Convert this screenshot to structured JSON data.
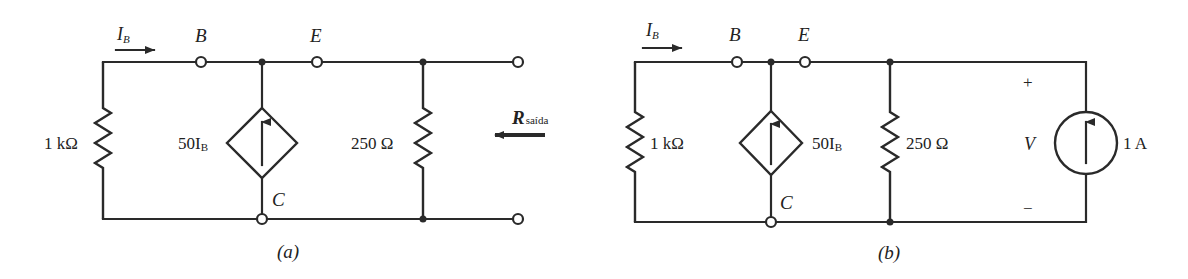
{
  "figure": {
    "colors": {
      "ink": "#2a2a2a",
      "background": "#ffffff"
    },
    "circuit_a": {
      "caption": "(a)",
      "current_label": {
        "main": "I",
        "sub": "B"
      },
      "nodes": {
        "base": "B",
        "emitter": "E",
        "collector": "C"
      },
      "resistor_left": "1 kΩ",
      "dependent_source": {
        "main": "50I",
        "sub": "B"
      },
      "resistor_right": "250 Ω",
      "output_resistance": {
        "main": "R",
        "sub": "saída"
      }
    },
    "circuit_b": {
      "caption": "(b)",
      "current_label": {
        "main": "I",
        "sub": "B"
      },
      "nodes": {
        "base": "B",
        "emitter": "E",
        "collector": "C"
      },
      "resistor_left": "1 kΩ",
      "dependent_source": {
        "main": "50I",
        "sub": "B"
      },
      "resistor_right": "250 Ω",
      "voltage_label": "V",
      "plus": "+",
      "minus": "−",
      "test_source": "1 A"
    }
  }
}
